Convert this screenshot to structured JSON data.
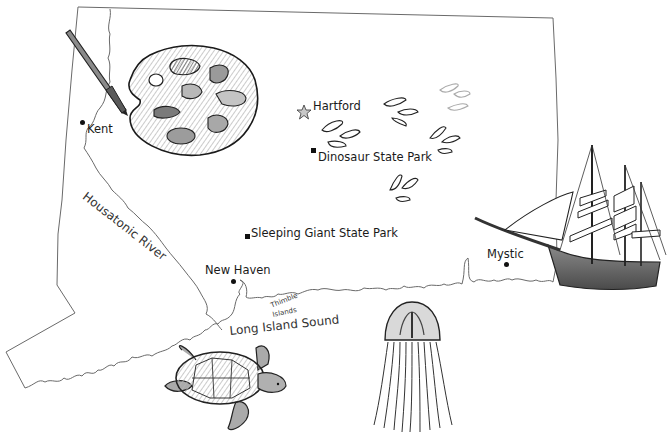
{
  "map": {
    "region": "Connecticut",
    "style": "hand-drawn pencil illustration",
    "colors": {
      "outline": "#555555",
      "ink": "#1a1a1a",
      "shading": "#9a9a9a",
      "background": "#ffffff"
    }
  },
  "cities": [
    {
      "name": "Kent",
      "marker": "dot"
    },
    {
      "name": "Hartford",
      "marker": "star"
    },
    {
      "name": "New Haven",
      "marker": "dot"
    },
    {
      "name": "Mystic",
      "marker": "dot"
    }
  ],
  "parks": [
    {
      "name": "Dinosaur State Park",
      "marker": "square"
    },
    {
      "name": "Sleeping Giant State Park",
      "marker": "square"
    }
  ],
  "water": {
    "river": "Housatonic River",
    "sound": "Long Island Sound",
    "islands_line1": "Thimble",
    "islands_line2": "Islands"
  },
  "illustrations": [
    "paint-palette",
    "paintbrush",
    "dinosaur-footprints",
    "tall-ship",
    "sea-turtle",
    "jellyfish"
  ]
}
